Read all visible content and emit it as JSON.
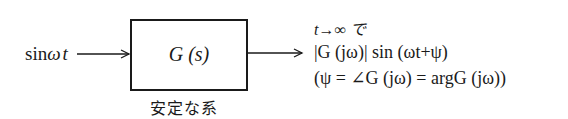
{
  "diagram": {
    "type": "block-diagram",
    "input": {
      "label": "sinωt",
      "parts": [
        "sin",
        "ω",
        "t"
      ]
    },
    "block": {
      "label": "G (s)",
      "caption": "安定な系"
    },
    "output": {
      "condition": "t→∞ で",
      "response": "|G (jω)|  sin (ωt+ψ)",
      "phase_definition": "(ψ = ∠G (jω) = argG (jω))"
    },
    "colors": {
      "line": "#1a1a1a",
      "background": "#ffffff"
    }
  }
}
